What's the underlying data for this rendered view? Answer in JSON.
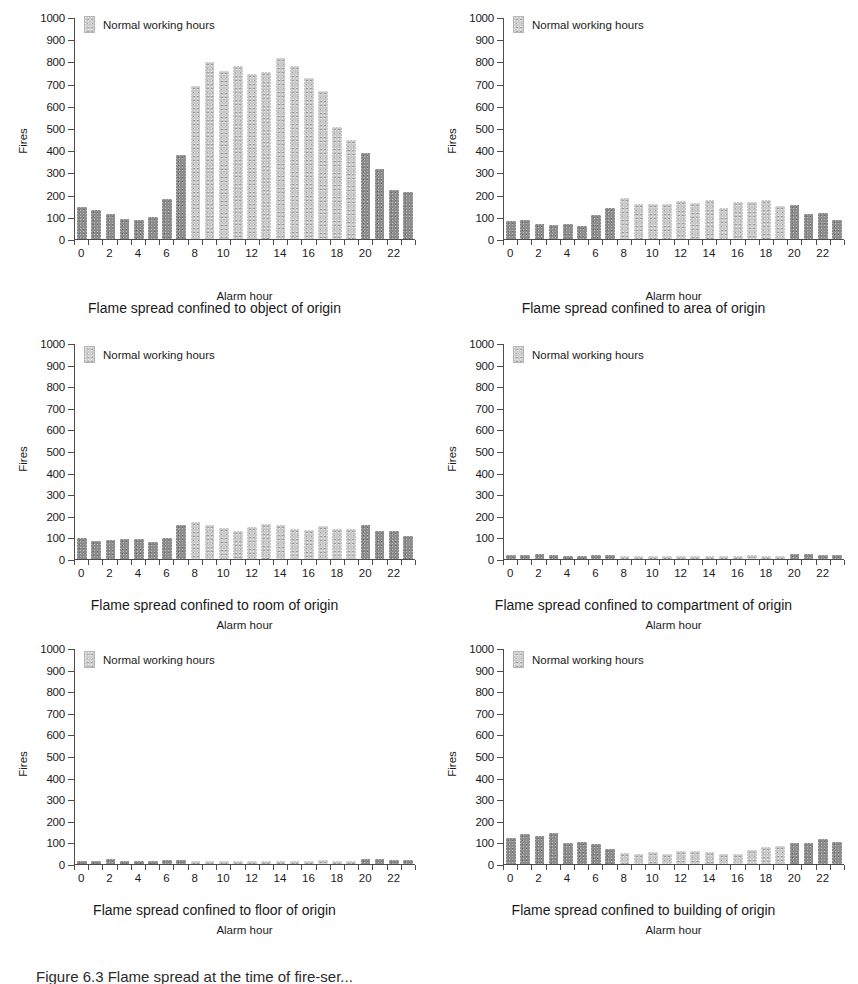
{
  "figure": {
    "caption_partial": "Figure 6.3  Flame spread at the time of fire-ser..."
  },
  "common": {
    "legend_label": "Normal working hours",
    "xlabel": "Alarm hour",
    "ylabel": "Fires",
    "yticks": [
      0,
      100,
      200,
      300,
      400,
      500,
      600,
      700,
      800,
      900,
      1000
    ],
    "xticks": [
      0,
      2,
      4,
      6,
      8,
      10,
      12,
      14,
      16,
      18,
      20,
      22
    ],
    "hours": [
      0,
      1,
      2,
      3,
      4,
      5,
      6,
      7,
      8,
      9,
      10,
      11,
      12,
      13,
      14,
      15,
      16,
      17,
      18,
      19,
      20,
      21,
      22,
      23
    ],
    "working_hours": [
      8,
      9,
      10,
      11,
      12,
      13,
      14,
      15,
      16,
      17,
      18,
      19
    ],
    "color_working": "#c9c9c9",
    "color_offhours": "#8c8c8c"
  },
  "chart_data": [
    {
      "id": "object-of-origin",
      "type": "bar",
      "title": "Flame spread confined to object of origin",
      "xlabel": "Alarm hour",
      "ylabel": "Fires",
      "ylim": [
        0,
        1000
      ],
      "grid": false,
      "legend": [
        "Normal working hours"
      ],
      "legend_position": "top-left",
      "categories": [
        0,
        1,
        2,
        3,
        4,
        5,
        6,
        7,
        8,
        9,
        10,
        11,
        12,
        13,
        14,
        15,
        16,
        17,
        18,
        19,
        20,
        21,
        22,
        23
      ],
      "values": [
        145,
        130,
        115,
        90,
        87,
        100,
        180,
        380,
        693,
        800,
        762,
        783,
        745,
        757,
        818,
        785,
        728,
        670,
        505,
        450,
        388,
        317,
        220,
        213
      ]
    },
    {
      "id": "area-of-origin",
      "type": "bar",
      "title": "Flame spread confined to area of origin",
      "xlabel": "Alarm hour",
      "ylabel": "Fires",
      "ylim": [
        0,
        1000
      ],
      "grid": false,
      "legend": [
        "Normal working hours"
      ],
      "legend_position": "top-left",
      "categories": [
        0,
        1,
        2,
        3,
        4,
        5,
        6,
        7,
        8,
        9,
        10,
        11,
        12,
        13,
        14,
        15,
        16,
        17,
        18,
        19,
        20,
        21,
        22,
        23
      ],
      "values": [
        80,
        84,
        70,
        65,
        68,
        57,
        107,
        140,
        185,
        158,
        160,
        160,
        170,
        163,
        175,
        142,
        168,
        168,
        178,
        150,
        152,
        115,
        119,
        88
      ]
    },
    {
      "id": "room-of-origin",
      "type": "bar",
      "title": "Flame spread confined to room of origin",
      "xlabel": "Alarm hour",
      "ylabel": "Fires",
      "ylim": [
        0,
        1000
      ],
      "grid": false,
      "legend": [
        "Normal working hours"
      ],
      "legend_position": "top-left",
      "categories": [
        0,
        1,
        2,
        3,
        4,
        5,
        6,
        7,
        8,
        9,
        10,
        11,
        12,
        13,
        14,
        15,
        16,
        17,
        18,
        19,
        20,
        21,
        22,
        23
      ],
      "values": [
        100,
        85,
        89,
        92,
        92,
        78,
        96,
        158,
        170,
        160,
        142,
        130,
        147,
        163,
        160,
        141,
        137,
        155,
        140,
        140,
        158,
        130,
        130,
        105
      ]
    },
    {
      "id": "compartment-of-origin",
      "type": "bar",
      "title": "Flame spread confined to compartment of origin",
      "xlabel": "Alarm hour",
      "ylabel": "Fires",
      "ylim": [
        0,
        1000
      ],
      "grid": false,
      "legend": [
        "Normal working hours"
      ],
      "legend_position": "top-left",
      "categories": [
        0,
        1,
        2,
        3,
        4,
        5,
        6,
        7,
        8,
        9,
        10,
        11,
        12,
        13,
        14,
        15,
        16,
        17,
        18,
        19,
        20,
        21,
        22,
        23
      ],
      "values": [
        18,
        18,
        24,
        18,
        16,
        16,
        20,
        20,
        12,
        14,
        9,
        10,
        11,
        14,
        10,
        9,
        10,
        20,
        11,
        14,
        22,
        22,
        18,
        20
      ]
    },
    {
      "id": "floor-of-origin",
      "type": "bar",
      "title": "Flame spread confined to floor of origin",
      "xlabel": "Alarm hour",
      "ylabel": "Fires",
      "ylim": [
        0,
        1000
      ],
      "grid": false,
      "legend": [
        "Normal working hours"
      ],
      "legend_position": "top-left",
      "categories": [
        0,
        1,
        2,
        3,
        4,
        5,
        6,
        7,
        8,
        9,
        10,
        11,
        12,
        13,
        14,
        15,
        16,
        17,
        18,
        19,
        20,
        21,
        22,
        23
      ],
      "values": [
        14,
        14,
        22,
        14,
        13,
        13,
        17,
        17,
        11,
        12,
        7,
        8,
        9,
        13,
        9,
        11,
        13,
        18,
        12,
        16,
        22,
        22,
        18,
        18
      ]
    },
    {
      "id": "building-of-origin",
      "type": "bar",
      "title": "Flame spread confined to building of origin",
      "xlabel": "Alarm hour",
      "ylabel": "Fires",
      "ylim": [
        0,
        1000
      ],
      "grid": false,
      "legend": [
        "Normal working hours"
      ],
      "legend_position": "top-left",
      "categories": [
        0,
        1,
        2,
        3,
        4,
        5,
        6,
        7,
        8,
        9,
        10,
        11,
        12,
        13,
        14,
        15,
        16,
        17,
        18,
        19,
        20,
        21,
        22,
        23
      ],
      "values": [
        120,
        138,
        128,
        145,
        100,
        103,
        93,
        68,
        52,
        48,
        54,
        48,
        60,
        62,
        55,
        48,
        46,
        67,
        80,
        86,
        98,
        98,
        118,
        102
      ]
    }
  ]
}
